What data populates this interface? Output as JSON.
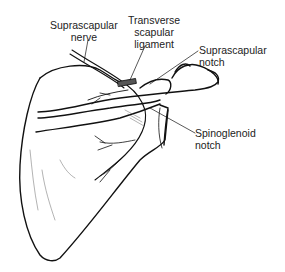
{
  "figure": {
    "labels": {
      "suprascapular_nerve": [
        "Suprascapular",
        "nerve"
      ],
      "transverse_scapular_ligament": [
        "Transverse",
        "scapular",
        "ligament"
      ],
      "suprascapular_notch": [
        "Suprascapular",
        "notch"
      ],
      "spinoglenoid_notch": [
        "Spinoglenoid",
        "notch"
      ]
    }
  }
}
